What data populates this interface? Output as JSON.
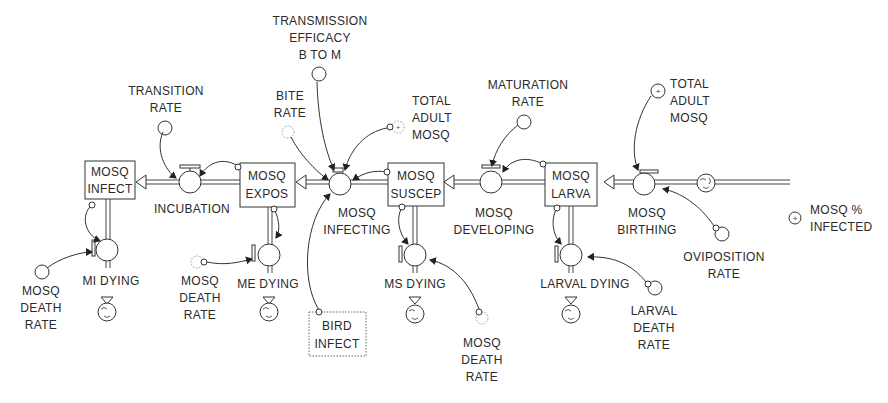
{
  "diagram": {
    "type": "stock-and-flow",
    "stocks": [
      {
        "id": "mosq_infect",
        "line1": "MOSQ",
        "line2": "INFECT"
      },
      {
        "id": "mosq_expos",
        "line1": "MOSQ",
        "line2": "EXPOS"
      },
      {
        "id": "mosq_suscep",
        "line1": "MOSQ",
        "line2": "SUSCEP"
      },
      {
        "id": "mosq_larva",
        "line1": "MOSQ",
        "line2": "LARVA"
      },
      {
        "id": "bird_infect",
        "line1": "BIRD",
        "line2": "INFECT",
        "ghost": true
      }
    ],
    "flows": [
      {
        "id": "incubation",
        "label": [
          "INCUBATION"
        ],
        "from": "mosq_expos",
        "to": "mosq_infect"
      },
      {
        "id": "mosq_infecting",
        "label": [
          "MOSQ",
          "INFECTING"
        ],
        "from": "mosq_suscep",
        "to": "mosq_expos"
      },
      {
        "id": "mosq_developing",
        "label": [
          "MOSQ",
          "DEVELOPING"
        ],
        "from": "mosq_larva",
        "to": "mosq_suscep"
      },
      {
        "id": "mosq_birthing",
        "label": [
          "MOSQ",
          "BIRTHING"
        ],
        "from": "cloud",
        "to": "mosq_larva"
      },
      {
        "id": "mi_dying",
        "label": [
          "MI DYING"
        ],
        "from": "mosq_infect",
        "to": "cloud"
      },
      {
        "id": "me_dying",
        "label": [
          "ME DYING"
        ],
        "from": "mosq_expos",
        "to": "cloud"
      },
      {
        "id": "ms_dying",
        "label": [
          "MS DYING"
        ],
        "from": "mosq_suscep",
        "to": "cloud"
      },
      {
        "id": "larval_dying",
        "label": [
          "LARVAL DYING"
        ],
        "from": "mosq_larva",
        "to": "cloud"
      }
    ],
    "converters": [
      {
        "id": "transition_rate",
        "label": [
          "TRANSITION",
          "RATE"
        ]
      },
      {
        "id": "transmission_efficacy",
        "label": [
          "TRANSMISSION",
          "EFFICACY",
          "B TO M"
        ]
      },
      {
        "id": "bite_rate",
        "label": [
          "BITE",
          "RATE"
        ],
        "ghost": true
      },
      {
        "id": "total_adult_mosq_1",
        "label": [
          "TOTAL",
          "ADULT",
          "MOSQ"
        ],
        "ghost": true
      },
      {
        "id": "maturation_rate",
        "label": [
          "MATURATION",
          "RATE"
        ]
      },
      {
        "id": "total_adult_mosq_2",
        "label": [
          "TOTAL",
          "ADULT",
          "MOSQ"
        ]
      },
      {
        "id": "mosq_death_rate_1",
        "label": [
          "MOSQ",
          "DEATH",
          "RATE"
        ]
      },
      {
        "id": "mosq_death_rate_2",
        "label": [
          "MOSQ",
          "DEATH",
          "RATE"
        ],
        "ghost": true
      },
      {
        "id": "mosq_death_rate_3",
        "label": [
          "MOSQ",
          "DEATH",
          "RATE"
        ],
        "ghost": true
      },
      {
        "id": "oviposition_rate",
        "label": [
          "OVIPOSITION",
          "RATE"
        ]
      },
      {
        "id": "larval_death_rate",
        "label": [
          "LARVAL",
          "DEATH",
          "RATE"
        ]
      },
      {
        "id": "mosq_pct_infected",
        "label": [
          "MOSQ %",
          "INFECTED"
        ]
      }
    ]
  }
}
